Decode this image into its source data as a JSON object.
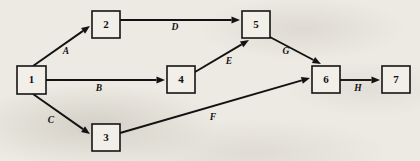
{
  "diagram": {
    "type": "directed-graph",
    "background_color": "#edeae3",
    "line_color": "#121212",
    "node_fill_color": "#f2efe8",
    "canvas": {
      "width": 420,
      "height": 161
    },
    "nodes": [
      {
        "id": "1",
        "label": "1",
        "x": 17,
        "y": 66,
        "w": 29,
        "h": 28
      },
      {
        "id": "2",
        "label": "2",
        "x": 92,
        "y": 11,
        "w": 28,
        "h": 27
      },
      {
        "id": "3",
        "label": "3",
        "x": 92,
        "y": 124,
        "w": 28,
        "h": 27
      },
      {
        "id": "4",
        "label": "4",
        "x": 167,
        "y": 66,
        "w": 28,
        "h": 27
      },
      {
        "id": "5",
        "label": "5",
        "x": 242,
        "y": 11,
        "w": 28,
        "h": 27
      },
      {
        "id": "6",
        "label": "6",
        "x": 312,
        "y": 66,
        "w": 28,
        "h": 27
      },
      {
        "id": "7",
        "label": "7",
        "x": 382,
        "y": 66,
        "w": 28,
        "h": 27
      }
    ],
    "edges": [
      {
        "id": "A",
        "label": "A",
        "from": "1",
        "to": "2",
        "x1": 33,
        "y1": 66,
        "x2": 90,
        "y2": 26,
        "label_x": 66,
        "label_y": 52
      },
      {
        "id": "B",
        "label": "B",
        "from": "1",
        "to": "4",
        "x1": 46,
        "y1": 80,
        "x2": 165,
        "y2": 80,
        "label_x": 99,
        "label_y": 89
      },
      {
        "id": "C",
        "label": "C",
        "from": "1",
        "to": "3",
        "x1": 33,
        "y1": 94,
        "x2": 90,
        "y2": 134,
        "label_x": 51,
        "label_y": 121
      },
      {
        "id": "D",
        "label": "D",
        "from": "2",
        "to": "5",
        "x1": 120,
        "y1": 20,
        "x2": 240,
        "y2": 20,
        "label_x": 175,
        "label_y": 28
      },
      {
        "id": "E",
        "label": "E",
        "from": "4",
        "to": "5",
        "x1": 195,
        "y1": 72,
        "x2": 249,
        "y2": 40,
        "label_x": 229,
        "label_y": 62
      },
      {
        "id": "F",
        "label": "F",
        "from": "3",
        "to": "6",
        "x1": 120,
        "y1": 133,
        "x2": 310,
        "y2": 78,
        "label_x": 213,
        "label_y": 118
      },
      {
        "id": "G",
        "label": "G",
        "from": "5",
        "to": "6",
        "x1": 268,
        "y1": 36,
        "x2": 321,
        "y2": 64,
        "label_x": 286,
        "label_y": 52
      },
      {
        "id": "H",
        "label": "H",
        "from": "6",
        "to": "7",
        "x1": 340,
        "y1": 80,
        "x2": 380,
        "y2": 80,
        "label_x": 358,
        "label_y": 89
      }
    ]
  }
}
